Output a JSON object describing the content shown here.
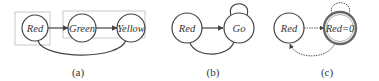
{
  "colors": {
    "stroke": "#444444",
    "box": "#bbbbbb",
    "text": "#333333"
  },
  "panels": [
    {
      "id": "a",
      "caption": "(a)",
      "nodes": [
        {
          "label": "Red"
        },
        {
          "label": "Green"
        },
        {
          "label": "Yellow"
        }
      ],
      "edges": [
        {
          "from": "Red",
          "to": "Green",
          "style": "solid"
        },
        {
          "from": "Green",
          "to": "Yellow",
          "style": "solid"
        },
        {
          "from": "Yellow",
          "to": "Red",
          "style": "solid",
          "shape": "curve-below"
        }
      ],
      "groups": [
        [
          "Red"
        ],
        [
          "Green",
          "Yellow"
        ]
      ]
    },
    {
      "id": "b",
      "caption": "(b)",
      "nodes": [
        {
          "label": "Red"
        },
        {
          "label": "Go"
        }
      ],
      "edges": [
        {
          "from": "Red",
          "to": "Go",
          "style": "solid"
        },
        {
          "from": "Go",
          "to": "Go",
          "style": "solid",
          "shape": "self-loop"
        },
        {
          "from": "Go",
          "to": "Red",
          "style": "solid",
          "shape": "curve-below"
        }
      ]
    },
    {
      "id": "c",
      "caption": "(c)",
      "nodes": [
        {
          "label": "Red"
        },
        {
          "label": "Red=0",
          "double_circle": true
        }
      ],
      "edges": [
        {
          "from": "Red",
          "to": "Red=0",
          "style": "dotted"
        },
        {
          "from": "Red=0",
          "to": "Red=0",
          "style": "dotted",
          "shape": "self-loop"
        },
        {
          "from": "Red=0",
          "to": "Red",
          "style": "dotted",
          "shape": "curve-below"
        }
      ]
    }
  ]
}
